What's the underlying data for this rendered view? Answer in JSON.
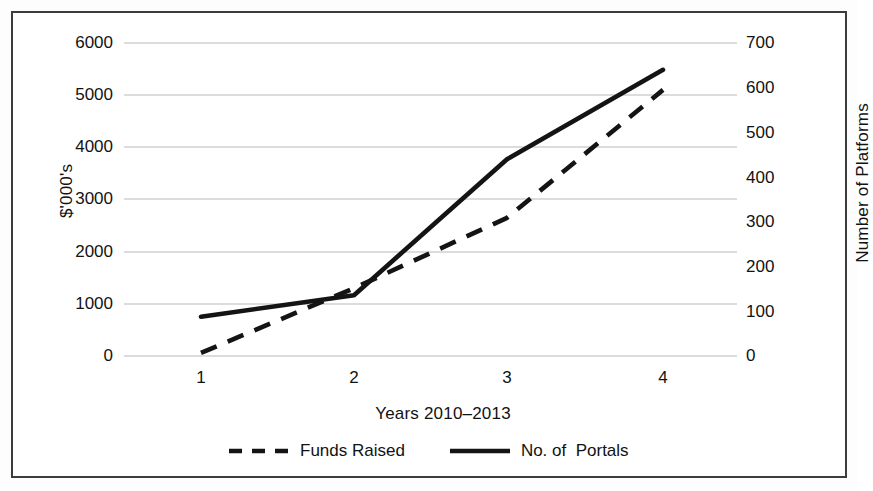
{
  "chart_data": {
    "type": "line",
    "title": "",
    "xlabel": "Years 2010–2013",
    "ylabel": "$'000's",
    "y2label": "Number of Platforms",
    "x": [
      1,
      2,
      3,
      4
    ],
    "xtick_labels": [
      "1",
      "2",
      "3",
      "4"
    ],
    "ylim": [
      0,
      6000
    ],
    "ytick_labels": [
      "0",
      "1000",
      "2000",
      "3000",
      "4000",
      "5000",
      "6000"
    ],
    "yticks": [
      0,
      1000,
      2000,
      3000,
      4000,
      5000,
      6000
    ],
    "y2lim": [
      0,
      700
    ],
    "y2tick_labels": [
      "0",
      "100",
      "200",
      "300",
      "400",
      "500",
      "600",
      "700"
    ],
    "y2ticks": [
      0,
      100,
      200,
      300,
      400,
      500,
      600,
      700
    ],
    "grid": "horizontal",
    "legend_position": "bottom-center",
    "series": [
      {
        "name": "Funds Raised",
        "axis": "left",
        "style": "dashed",
        "color": "#111111",
        "values": [
          60,
          1300,
          2650,
          5100
        ]
      },
      {
        "name": "No. of  Portals",
        "axis": "right",
        "style": "solid",
        "color": "#111111",
        "values": [
          88,
          136,
          440,
          640
        ]
      }
    ]
  },
  "legend": {
    "items": [
      {
        "label": "Funds Raised",
        "swatch": "dashed-line-swatch"
      },
      {
        "label": "No. of  Portals",
        "swatch": "solid-line-swatch"
      }
    ]
  },
  "axes": {
    "left_title": "$'000's",
    "right_title": "Number of Platforms",
    "x_title": "Years 2010–2013",
    "left_ticks": [
      "6000",
      "5000",
      "4000",
      "3000",
      "2000",
      "1000",
      "0"
    ],
    "right_ticks": [
      "700",
      "600",
      "500",
      "400",
      "300",
      "200",
      "100",
      "0"
    ],
    "x_ticks": [
      "1",
      "2",
      "3",
      "4"
    ]
  }
}
